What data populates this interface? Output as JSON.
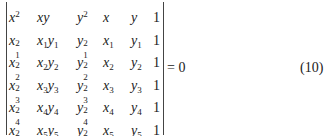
{
  "equation": {
    "rows": [
      {
        "c0": "x²",
        "c1": "xy",
        "c2": "y²",
        "c3": "x",
        "c4": "y",
        "c5": "1"
      },
      {
        "c0": "x₁²",
        "c1": "x₁y₁",
        "c2": "y₁²",
        "c3": "x₁",
        "c4": "y₁",
        "c5": "1"
      },
      {
        "c0": "x₂²",
        "c1": "x₂y₂",
        "c2": "y₂²",
        "c3": "x₂",
        "c4": "y₂",
        "c5": "1"
      },
      {
        "c0": "x₃²",
        "c1": "x₃y₃",
        "c2": "y₃²",
        "c3": "x₃",
        "c4": "y₃",
        "c5": "1"
      },
      {
        "c0": "x₄²",
        "c1": "x₄y₄",
        "c2": "y₄²",
        "c3": "x₄",
        "c4": "y₄",
        "c5": "1"
      },
      {
        "c0": "x₅²",
        "c1": "x₅y₅",
        "c2": "y₅²",
        "c3": "x₅",
        "c4": "y₅",
        "c5": "1"
      }
    ],
    "rhs": "= 0",
    "number": "(10)"
  }
}
